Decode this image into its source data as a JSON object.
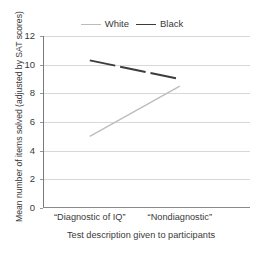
{
  "chart_data": {
    "type": "line",
    "title": "",
    "xlabel": "Test description given to participants",
    "ylabel": "Mean number of items solved (adjusted by SAT scores)",
    "categories": [
      "“Diagnostic of IQ”",
      "“Nondiagnostic”"
    ],
    "x": [
      0,
      1
    ],
    "ylim": [
      0,
      12
    ],
    "yticks": [
      0,
      2,
      4,
      6,
      8,
      10,
      12
    ],
    "ytick_labels": [
      "0",
      "2",
      "4",
      "6",
      "8",
      "10",
      "12"
    ],
    "grid": true,
    "legend_position": "top-center",
    "series": [
      {
        "name": "White",
        "values": [
          5.0,
          8.5
        ],
        "color": "#bcbcbc",
        "linestyle": "solid"
      },
      {
        "name": "Black",
        "values": [
          10.3,
          9.0
        ],
        "color": "#3c3c3c",
        "linestyle": "dashed"
      }
    ]
  },
  "legend": {
    "entries": [
      {
        "label": "White"
      },
      {
        "label": "Black"
      }
    ]
  },
  "axes": {
    "y_title": "Mean number of items solved (adjusted by SAT scores)",
    "x_title": "Test description given to participants"
  }
}
